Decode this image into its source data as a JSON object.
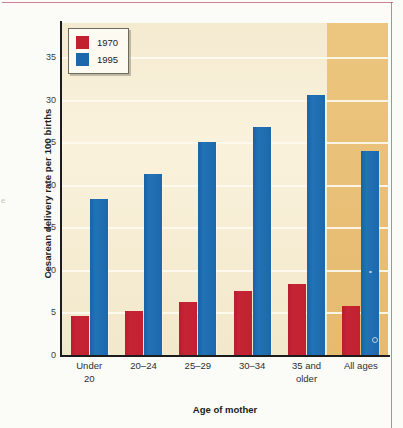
{
  "chart_data": {
    "type": "bar",
    "title": "",
    "xlabel": "Age of mother",
    "ylabel": "Cesarean delivery rate per 100 births",
    "categories": [
      "Under 20",
      "20–24",
      "25–29",
      "30–34",
      "35 and older",
      "All ages"
    ],
    "category_lines": [
      [
        "Under",
        "20"
      ],
      [
        "20–24"
      ],
      [
        "25–29"
      ],
      [
        "30–34"
      ],
      [
        "35 and",
        "older"
      ],
      [
        "All ages"
      ]
    ],
    "series": [
      {
        "name": "1970",
        "color": "#c2212f",
        "values": [
          4.6,
          5.2,
          6.2,
          7.5,
          8.3,
          5.8
        ]
      },
      {
        "name": "1995",
        "color": "#1d68ad",
        "values": [
          18.3,
          21.3,
          25.0,
          26.8,
          30.5,
          24.0
        ]
      }
    ],
    "ylim": [
      0,
      39
    ],
    "yticks": [
      0,
      5,
      10,
      15,
      20,
      25,
      30,
      35
    ],
    "ytick_labels": [
      "0",
      "5",
      "10",
      "15",
      "20",
      "25",
      "30",
      "35"
    ],
    "grid": true,
    "legend_position": "top-left",
    "highlighted_category": "All ages",
    "colors": {
      "plot_background": "#f7eed5",
      "highlight_band": "#e9c077",
      "gridline": "#fdfaf0",
      "axis": "#1c1c1c",
      "series_1970": "#c2212f",
      "series_1995": "#1d68ad",
      "page_border": "#c0566a"
    }
  },
  "legend": {
    "items": [
      {
        "label": "1970"
      },
      {
        "label": "1995"
      }
    ]
  },
  "artifacts": {
    "left_edge_bleed": "e"
  }
}
